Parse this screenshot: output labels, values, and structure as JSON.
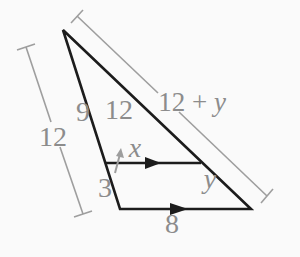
{
  "figure": {
    "colors": {
      "background": "#fafafa",
      "triangle-line": "#1c1c1c",
      "dimension-line": "#9e9e9e",
      "label-text": "#8c8c8c"
    },
    "labels": {
      "left_total": "12",
      "left_upper": "9",
      "left_lower": "3",
      "hyp_upper": "12",
      "hyp_total_prefix": "12 + ",
      "hyp_total_var": "y",
      "mid_segment_var": "x",
      "hyp_lower_var": "y",
      "base": "8"
    }
  }
}
